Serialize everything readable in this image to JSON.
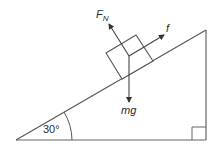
{
  "diagram": {
    "incline_angle_label": "30°",
    "forces": {
      "normal": {
        "symbol": "F",
        "subscript": "N"
      },
      "friction": {
        "symbol": "f"
      },
      "weight": {
        "symbol": "mg"
      }
    },
    "colors": {
      "line": "#555555",
      "text": "#2b2b2b",
      "background": "#ffffff"
    }
  }
}
